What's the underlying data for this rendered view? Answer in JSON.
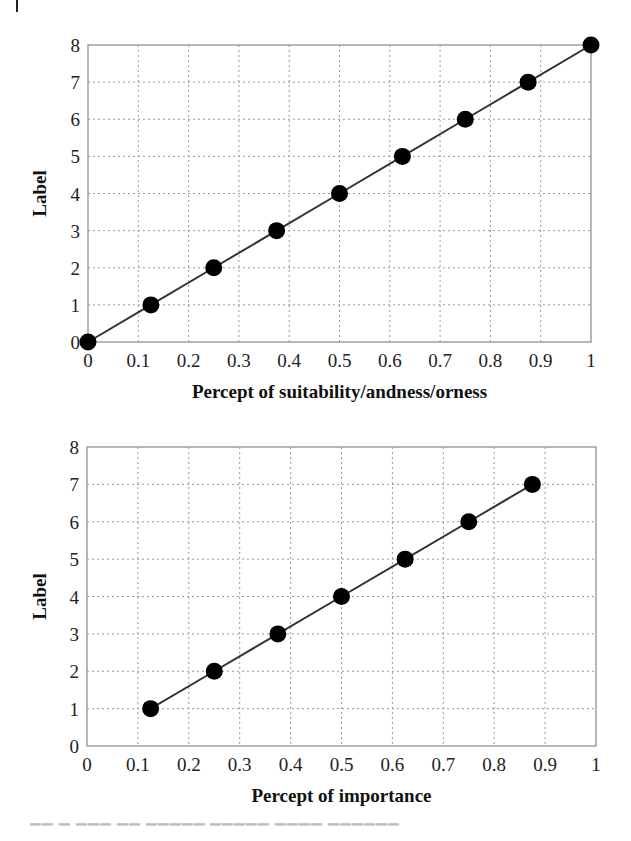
{
  "chart_data": [
    {
      "type": "line",
      "title": "",
      "xlabel": "Percept of suitability/andness/orness",
      "ylabel": "Label",
      "xlim": [
        0,
        1
      ],
      "ylim": [
        0,
        8
      ],
      "xticks": [
        "0",
        "0.1",
        "0.2",
        "0.3",
        "0.4",
        "0.5",
        "0.6",
        "0.7",
        "0.8",
        "0.9",
        "1"
      ],
      "yticks": [
        "0",
        "1",
        "2",
        "3",
        "4",
        "5",
        "6",
        "7",
        "8"
      ],
      "grid": true,
      "markers": "filled-circle",
      "series": [
        {
          "name": "Label",
          "x": [
            0,
            0.125,
            0.25,
            0.375,
            0.5,
            0.625,
            0.75,
            0.875,
            1.0
          ],
          "y": [
            0,
            1,
            2,
            3,
            4,
            5,
            6,
            7,
            8
          ]
        }
      ]
    },
    {
      "type": "line",
      "title": "",
      "xlabel": "Percept of importance",
      "ylabel": "Label",
      "xlim": [
        0,
        1
      ],
      "ylim": [
        0,
        8
      ],
      "xticks": [
        "0",
        "0.1",
        "0.2",
        "0.3",
        "0.4",
        "0.5",
        "0.6",
        "0.7",
        "0.8",
        "0.9",
        "1"
      ],
      "yticks": [
        "0",
        "1",
        "2",
        "3",
        "4",
        "5",
        "6",
        "7",
        "8"
      ],
      "grid": true,
      "markers": "filled-circle",
      "series": [
        {
          "name": "Label",
          "x": [
            0.125,
            0.25,
            0.375,
            0.5,
            0.625,
            0.75,
            0.875
          ],
          "y": [
            1,
            2,
            3,
            4,
            5,
            6,
            7
          ]
        }
      ]
    }
  ],
  "layout": {
    "plots": [
      {
        "left": 88,
        "right": 591,
        "top": 45,
        "bottom": 342
      },
      {
        "left": 87,
        "right": 596,
        "top": 447,
        "bottom": 746
      }
    ],
    "colors": {
      "line": "#333333",
      "marker": "#000000",
      "grid": "#999999",
      "frame": "#888888"
    }
  }
}
